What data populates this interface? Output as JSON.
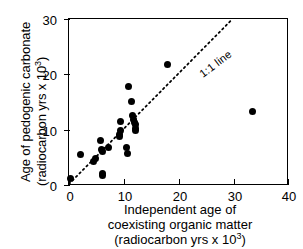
{
  "chart_data": {
    "type": "scatter",
    "title": "",
    "xlabel": "Independent age of coexisting organic matter (radiocarbon yrs x 10^3)",
    "ylabel": "Age of pedogenic carbonate (radiocarbon yrs x 10^3)",
    "xlim": [
      0,
      40
    ],
    "ylim": [
      0,
      30
    ],
    "xticks": [
      0,
      10,
      20,
      30,
      40
    ],
    "yticks": [
      0,
      10,
      20,
      30
    ],
    "grid": false,
    "legend": null,
    "annotations": [
      {
        "text": "1:1 line",
        "x": 17.5,
        "y": 21.0,
        "rotation": 37
      }
    ],
    "reference_line": {
      "name": "1:1 line",
      "style": "dotted",
      "slope": 1,
      "intercept": 0,
      "x_start": 0,
      "x_end": 30,
      "y_start": 0,
      "y_end": 30
    },
    "series": [
      {
        "name": "pedogenic carbonate vs organic matter",
        "marker": "filled-circle",
        "color": "#000000",
        "points": [
          [
            0.2,
            1.3
          ],
          [
            2.1,
            5.6
          ],
          [
            4.4,
            4.4
          ],
          [
            4.9,
            4.9
          ],
          [
            5.7,
            8.2
          ],
          [
            5.9,
            6.5
          ],
          [
            6.0,
            6.2
          ],
          [
            6.1,
            2.2
          ],
          [
            6.1,
            1.9
          ],
          [
            7.1,
            6.9
          ],
          [
            9.1,
            9.3
          ],
          [
            9.2,
            8.9
          ],
          [
            9.3,
            11.5
          ],
          [
            9.4,
            9.9
          ],
          [
            10.5,
            7.0
          ],
          [
            10.6,
            5.8
          ],
          [
            10.8,
            17.9
          ],
          [
            11.3,
            15.2
          ],
          [
            11.6,
            12.6
          ],
          [
            11.8,
            12.0
          ],
          [
            11.9,
            11.4
          ],
          [
            12.0,
            11.0
          ],
          [
            12.0,
            10.4
          ],
          [
            12.1,
            10.0
          ],
          [
            17.9,
            21.9
          ],
          [
            33.4,
            13.3
          ]
        ]
      }
    ]
  },
  "axes": {
    "y_title_line1": "Age of pedogenic carbonate",
    "y_title_line2_pre": "(radiocarbon yrs x 10",
    "y_title_line2_sup": "3",
    "y_title_line2_post": ")",
    "x_title_line1": "Independent age of",
    "x_title_line2": "coexisting organic matter",
    "x_title_line3_pre": "(radiocarbon yrs x 10",
    "x_title_line3_sup": "3",
    "x_title_line3_post": ")",
    "x_tick_labels": [
      "0",
      "10",
      "20",
      "30",
      "40"
    ],
    "y_tick_labels": [
      "0",
      "10",
      "20",
      "30"
    ]
  },
  "annotation": {
    "one_to_one": "1:1 line"
  }
}
